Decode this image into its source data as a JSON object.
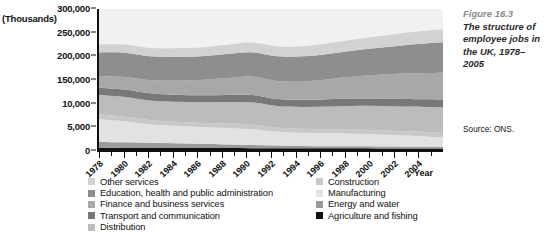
{
  "figure": {
    "number": "Figure 16.3",
    "caption": "The structure of employee jobs in the UK, 1978–2005",
    "source": "Source: ONS."
  },
  "axes": {
    "y_unit_label": "(Thousands)",
    "x_axis_title": "Year",
    "y_ticks": [
      "0",
      "5,000",
      "10,000",
      "150,000",
      "200,000",
      "250,000",
      "300,000"
    ],
    "x_ticks": [
      "1978",
      "1980",
      "1982",
      "1984",
      "1986",
      "1988",
      "1990",
      "1992",
      "1994",
      "1996",
      "1998",
      "2000",
      "2002",
      "2004"
    ]
  },
  "legend": {
    "left_column": [
      {
        "label": "Other services",
        "color": "#d2d2d2"
      },
      {
        "label": "Education, health and  public administration",
        "color": "#8e8e8e"
      },
      {
        "label": "Finance and business services",
        "color": "#a8a8a8"
      },
      {
        "label": "Transport and communication",
        "color": "#787878"
      },
      {
        "label": "Distribution",
        "color": "#bcbcbc"
      }
    ],
    "right_column": [
      {
        "label": "Construction",
        "color": "#c8c8c8"
      },
      {
        "label": "Manufacturing",
        "color": "#e2e2e2"
      },
      {
        "label": "Energy and water",
        "color": "#9a9a9a"
      },
      {
        "label": "Agriculture and fishing",
        "color": "#111111"
      }
    ]
  },
  "chart_data": {
    "type": "area",
    "title": "The structure of employee jobs in the UK, 1978–2005",
    "xlabel": "Year",
    "ylabel": "(Thousands)",
    "ylim": [
      0,
      300000
    ],
    "grid": false,
    "legend_position": "bottom",
    "stacked": true,
    "x": [
      1978,
      1980,
      1982,
      1984,
      1986,
      1988,
      1990,
      1992,
      1994,
      1996,
      1998,
      2000,
      2002,
      2004,
      2005
    ],
    "y_tick_values": [
      0,
      5000,
      10000,
      150000,
      200000,
      250000,
      300000
    ],
    "series": [
      {
        "name": "Agriculture and fishing",
        "color": "#111111",
        "values": [
          4200,
          4000,
          3900,
          3800,
          3700,
          3600,
          3500,
          3400,
          3300,
          3200,
          3100,
          3000,
          2900,
          2800,
          2800
        ]
      },
      {
        "name": "Energy and water",
        "color": "#9a9a9a",
        "values": [
          11000,
          10500,
          10000,
          9000,
          8000,
          7000,
          6000,
          5000,
          4500,
          4000,
          3800,
          3600,
          3400,
          3200,
          3200
        ]
      },
      {
        "name": "Manufacturing",
        "color": "#e2e2e2",
        "values": [
          43000,
          40000,
          35000,
          33000,
          32000,
          31000,
          30000,
          26000,
          25000,
          25000,
          24000,
          23000,
          21000,
          19000,
          18500
        ]
      },
      {
        "name": "Construction",
        "color": "#c8c8c8",
        "values": [
          9000,
          8800,
          8200,
          8000,
          8000,
          8500,
          9000,
          8000,
          7500,
          7500,
          7800,
          8000,
          8200,
          8500,
          8600
        ]
      },
      {
        "name": "Distribution",
        "color": "#bcbcbc",
        "values": [
          37000,
          37500,
          37000,
          38000,
          39000,
          41000,
          42000,
          41000,
          41500,
          43000,
          45000,
          46000,
          47000,
          48000,
          48000
        ]
      },
      {
        "name": "Transport and communication",
        "color": "#787878",
        "values": [
          14000,
          13800,
          13500,
          13200,
          13200,
          13500,
          14000,
          13500,
          13400,
          13700,
          14000,
          14300,
          14500,
          14600,
          14600
        ]
      },
      {
        "name": "Finance and business services",
        "color": "#a8a8a8",
        "values": [
          22000,
          24000,
          25000,
          27000,
          29000,
          32000,
          35000,
          34000,
          35000,
          38000,
          42000,
          45000,
          48000,
          50000,
          51000
        ]
      },
      {
        "name": "Education, health and  public administration",
        "color": "#8e8e8e",
        "values": [
          45000,
          46000,
          45500,
          45000,
          45000,
          45500,
          46000,
          47000,
          47500,
          48000,
          49000,
          51000,
          54000,
          57000,
          58000
        ]
      },
      {
        "name": "Other services",
        "color": "#d2d2d2",
        "values": [
          15000,
          15500,
          15500,
          16000,
          16500,
          17500,
          18500,
          18500,
          19000,
          20000,
          21000,
          22000,
          23000,
          24000,
          24000
        ]
      }
    ]
  }
}
